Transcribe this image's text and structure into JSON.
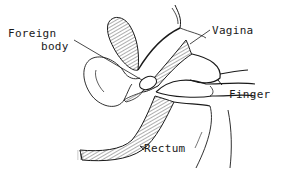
{
  "figure": {
    "type": "anatomical line drawing",
    "labels": [
      {
        "id": "foreign_body",
        "lines": [
          "Foreign",
          "body"
        ]
      },
      {
        "id": "vagina",
        "text": "Vagina"
      },
      {
        "id": "finger",
        "text": "Finger"
      },
      {
        "id": "rectum",
        "text": "Rectum"
      }
    ],
    "colors": {
      "ink": "#1a1a1a",
      "background": "#ffffff"
    }
  }
}
